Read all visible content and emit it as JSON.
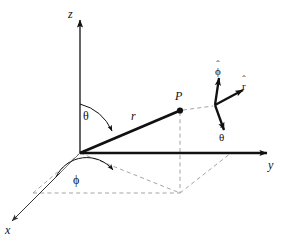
{
  "figure": {
    "background_color": "#ffffff",
    "line_color": "#111111",
    "dashed_color": "#9a9a9a"
  },
  "axes": [
    {
      "name": "z-axis",
      "label": "z",
      "direction": "up"
    },
    {
      "name": "y-axis",
      "label": "y",
      "direction": "right"
    },
    {
      "name": "x-axis",
      "label": "x",
      "direction": "down-left"
    }
  ],
  "labels": {
    "z_axis": "z",
    "y_axis": "y",
    "x_axis": "x",
    "point": "P",
    "radius": "r",
    "theta": "θ",
    "phi": "ϕ"
  },
  "unit_vectors": [
    {
      "name": "r-hat",
      "glyph": "r",
      "hat": "ˆ",
      "direction": "right"
    },
    {
      "name": "theta-hat",
      "glyph": "θ",
      "hat": "ˆ",
      "direction": "down-right"
    },
    {
      "name": "phi-hat",
      "glyph": "ϕ",
      "hat": "ˆ",
      "direction": "up-left"
    }
  ],
  "geometry": {
    "origin": {
      "x": 80,
      "y": 153
    },
    "point_P": {
      "x": 180,
      "y": 110
    },
    "projection_xy": {
      "x": 180,
      "y": 192
    },
    "triad_vertex": {
      "x": 215,
      "y": 105
    }
  }
}
